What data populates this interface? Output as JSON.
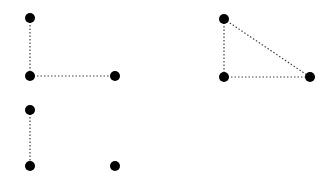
{
  "style": {
    "background": "#ffffff",
    "node_color": "#000000",
    "edge_color": "#444444",
    "node_radius": 5,
    "edge_dash": "1.5,2",
    "edge_width": 1.2
  },
  "panels": [
    {
      "id": "panel-1",
      "nodes": [
        {
          "id": "a",
          "x": 30,
          "y": 18
        },
        {
          "id": "b",
          "x": 30,
          "y": 76
        },
        {
          "id": "c",
          "x": 115,
          "y": 76
        }
      ],
      "edges": [
        {
          "from": "a",
          "to": "b"
        },
        {
          "from": "b",
          "to": "c"
        }
      ]
    },
    {
      "id": "panel-2",
      "nodes": [
        {
          "id": "a",
          "x": 224,
          "y": 19
        },
        {
          "id": "b",
          "x": 224,
          "y": 77
        },
        {
          "id": "c",
          "x": 310,
          "y": 77
        }
      ],
      "edges": [
        {
          "from": "a",
          "to": "b"
        },
        {
          "from": "b",
          "to": "c"
        },
        {
          "from": "a",
          "to": "c"
        }
      ]
    },
    {
      "id": "panel-3",
      "nodes": [
        {
          "id": "a",
          "x": 30,
          "y": 110
        },
        {
          "id": "b",
          "x": 30,
          "y": 166
        },
        {
          "id": "c",
          "x": 115,
          "y": 166
        }
      ],
      "edges": [
        {
          "from": "a",
          "to": "b"
        }
      ]
    }
  ]
}
